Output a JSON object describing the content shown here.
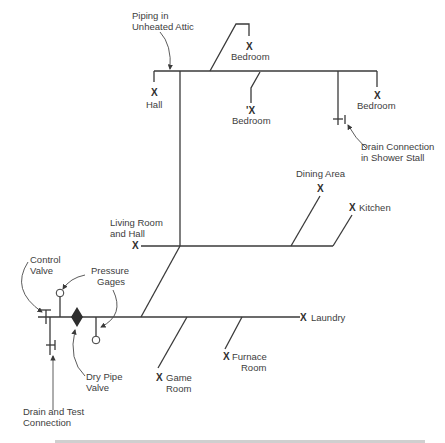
{
  "diagram": {
    "type": "dry-pipe sprinkler piping isometric schematic",
    "colors": {
      "line": "#3a3a3a",
      "text": "#3d3d3d",
      "background": "#ffffff"
    },
    "sprinkler_mark": "X",
    "callouts": {
      "attic": [
        "Piping in",
        "Unheated Attic"
      ],
      "drain_shower": [
        "Drain Connection",
        "in Shower Stall"
      ],
      "control_valve": [
        "Control",
        "Valve"
      ],
      "pressure_gages": [
        "Pressure",
        "Gages"
      ],
      "dry_pipe_valve": [
        "Dry Pipe",
        "Valve"
      ],
      "drain_test": [
        "Drain and Test",
        "Connection"
      ]
    },
    "rooms": {
      "hall": "Hall",
      "bedroom_top": "Bedroom",
      "bedroom_middle": "Bedroom",
      "bedroom_middle_mark": "'X",
      "bedroom_right": "Bedroom",
      "dining": "Dining Area",
      "kitchen": "Kitchen",
      "living": [
        "Living Room",
        "and Hall"
      ],
      "laundry": "Laundry",
      "game": [
        "Game",
        "Room"
      ],
      "furnace": [
        "Furnace",
        "Room"
      ]
    },
    "caption_partial": "Figure . . . (caption cut off at bottom edge)"
  }
}
